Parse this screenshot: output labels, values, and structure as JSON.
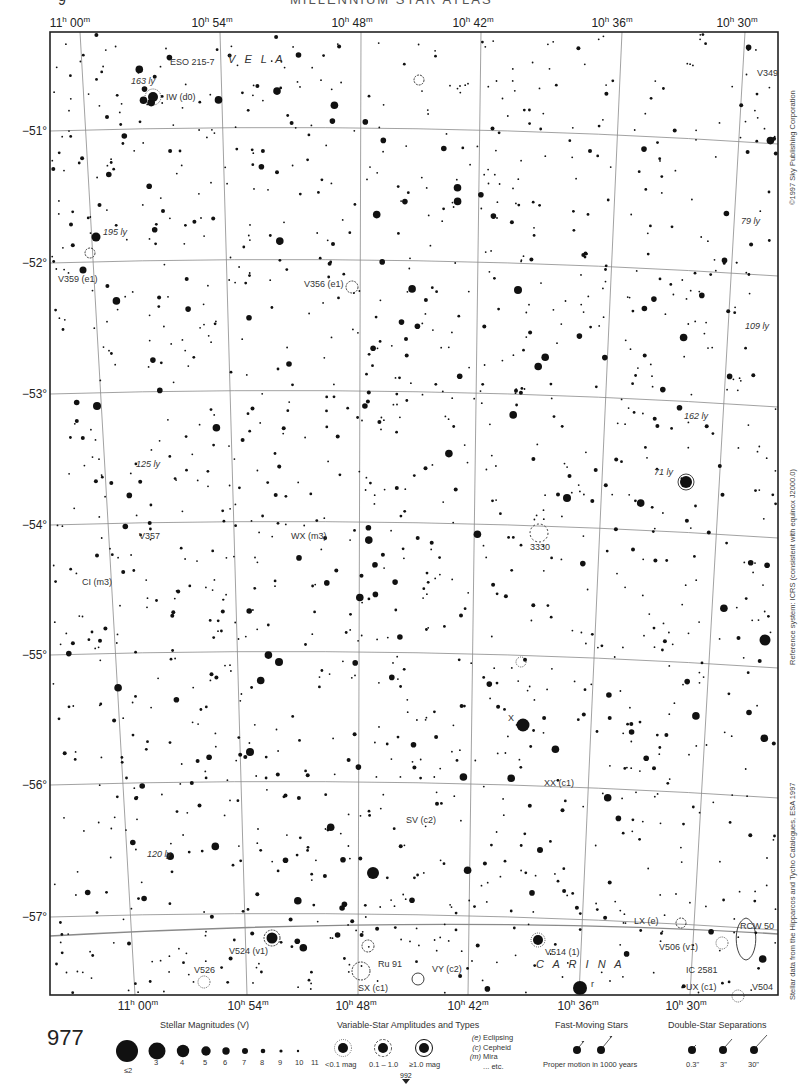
{
  "header": {
    "page_number_top": "9",
    "atlas_title": "MILLENNIUM STAR ATLAS"
  },
  "map": {
    "frame": {
      "left": 50,
      "top": 32,
      "right": 778,
      "bottom": 995
    },
    "ra_labels_top": [
      {
        "h": "11",
        "m": "00",
        "x": 70
      },
      {
        "h": "10",
        "m": "54",
        "x": 212
      },
      {
        "h": "10",
        "m": "48",
        "x": 352
      },
      {
        "h": "10",
        "m": "42",
        "x": 473
      },
      {
        "h": "10",
        "m": "36",
        "x": 612
      },
      {
        "h": "10",
        "m": "30",
        "x": 737
      }
    ],
    "ra_labels_bottom": [
      {
        "h": "11",
        "m": "00",
        "x": 138
      },
      {
        "h": "10",
        "m": "54",
        "x": 248
      },
      {
        "h": "10",
        "m": "48",
        "x": 356
      },
      {
        "h": "10",
        "m": "42",
        "x": 468
      },
      {
        "h": "10",
        "m": "36",
        "x": 578
      },
      {
        "h": "10",
        "m": "30",
        "x": 686
      }
    ],
    "dec_labels": [
      {
        "label": "−51°",
        "y": 131
      },
      {
        "label": "−52°",
        "y": 263
      },
      {
        "label": "−53°",
        "y": 394
      },
      {
        "label": "−54°",
        "y": 525
      },
      {
        "label": "−55°",
        "y": 655
      },
      {
        "label": "−56°",
        "y": 785
      },
      {
        "label": "−57°",
        "y": 917
      }
    ],
    "constellations": [
      {
        "name": "V E L A",
        "x": 228,
        "y": 63
      },
      {
        "name": "C A R I N A",
        "x": 536,
        "y": 968
      }
    ],
    "labels": [
      {
        "text": "ESO 215-7",
        "x": 170,
        "y": 65,
        "italic": false
      },
      {
        "text": "163 ly",
        "x": 131,
        "y": 84,
        "italic": true
      },
      {
        "text": "IW (d0)",
        "x": 166,
        "y": 100,
        "italic": false
      },
      {
        "text": "V349",
        "x": 757,
        "y": 76,
        "italic": false
      },
      {
        "text": "79 ly",
        "x": 741,
        "y": 224,
        "italic": true
      },
      {
        "text": "195 ly",
        "x": 103,
        "y": 235,
        "italic": true
      },
      {
        "text": "V359 (e1)",
        "x": 58,
        "y": 282,
        "italic": false
      },
      {
        "text": "V356 (e1)",
        "x": 304,
        "y": 287,
        "italic": false
      },
      {
        "text": "109 ly",
        "x": 745,
        "y": 329,
        "italic": true
      },
      {
        "text": "162 ly",
        "x": 684,
        "y": 419,
        "italic": true
      },
      {
        "text": "125 ly",
        "x": 136,
        "y": 467,
        "italic": true
      },
      {
        "text": "71 ly",
        "x": 654,
        "y": 475,
        "italic": true
      },
      {
        "text": "V357",
        "x": 139,
        "y": 539,
        "italic": false
      },
      {
        "text": "WX (m3)",
        "x": 291,
        "y": 539,
        "italic": false
      },
      {
        "text": "3330",
        "x": 530,
        "y": 550,
        "italic": false
      },
      {
        "text": "CI (m3)",
        "x": 82,
        "y": 585,
        "italic": false
      },
      {
        "text": "X",
        "x": 508,
        "y": 721,
        "italic": false
      },
      {
        "text": "XX (c1)",
        "x": 544,
        "y": 786,
        "italic": false
      },
      {
        "text": "SV (c2)",
        "x": 406,
        "y": 823,
        "italic": false
      },
      {
        "text": "120 ly",
        "x": 147,
        "y": 857,
        "italic": true
      },
      {
        "text": "LX (e)",
        "x": 634,
        "y": 924,
        "italic": false
      },
      {
        "text": "RCW 50",
        "x": 740,
        "y": 929,
        "italic": false
      },
      {
        "text": "V524 (v1)",
        "x": 229,
        "y": 954,
        "italic": false
      },
      {
        "text": "V514 (1)",
        "x": 545,
        "y": 955,
        "italic": false
      },
      {
        "text": "V506 (v1)",
        "x": 659,
        "y": 950,
        "italic": false
      },
      {
        "text": "Ru 91",
        "x": 378,
        "y": 967,
        "italic": false
      },
      {
        "text": "VY (c2)",
        "x": 432,
        "y": 972,
        "italic": false
      },
      {
        "text": "IC 2581",
        "x": 686,
        "y": 973,
        "italic": false
      },
      {
        "text": "V526",
        "x": 194,
        "y": 973,
        "italic": false
      },
      {
        "text": "SX (c1)",
        "x": 358,
        "y": 991,
        "italic": false
      },
      {
        "text": "UX (c1)",
        "x": 686,
        "y": 990,
        "italic": false
      },
      {
        "text": "V504",
        "x": 752,
        "y": 990,
        "italic": false
      },
      {
        "text": "r",
        "x": 591,
        "y": 987,
        "italic": false
      }
    ],
    "side_texts": {
      "copyright": "©1997 Sky Publishing Corporation",
      "reference": "Reference system: ICRS (consistent with equinox J2000.0)",
      "data_source": "Stellar data from the Hipparcos and Tycho Catalogues, ESA 1997"
    }
  },
  "legend": {
    "page_number": "977",
    "next_page": "992",
    "magnitudes": {
      "title": "Stellar Magnitudes (V)",
      "items": [
        "≤2",
        "3",
        "4",
        "5",
        "6",
        "7",
        "8",
        "9",
        "10",
        "11"
      ]
    },
    "variables": {
      "title": "Variable-Star Amplitudes and Types",
      "amplitudes": [
        "<0.1 mag",
        "0.1 – 1.0",
        "≥1.0 mag"
      ],
      "types": [
        {
          "code": "(e)",
          "label": "Eclipsing"
        },
        {
          "code": "(c)",
          "label": "Cepheid"
        },
        {
          "code": "(m)",
          "label": "Mira"
        },
        {
          "code": "",
          "label": "... etc."
        }
      ]
    },
    "fast_moving": {
      "title": "Fast-Moving Stars",
      "caption": "Proper motion in 1000 years"
    },
    "doubles": {
      "title": "Double-Star Separations",
      "items": [
        "0.3\"",
        "3\"",
        "30\""
      ]
    }
  },
  "colors": {
    "ink": "#111111",
    "grid": "#8a8a8a",
    "paper": "#ffffff"
  }
}
